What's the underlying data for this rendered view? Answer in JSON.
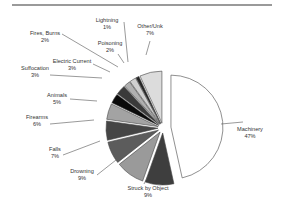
{
  "chart_data": {
    "type": "pie",
    "title": "",
    "exploded": true,
    "start_angle_deg": 0,
    "direction": "clockwise",
    "slices": [
      {
        "label": "Machinery",
        "value": 47,
        "pct_label": "47%",
        "color": "#ffffff",
        "explode": 8
      },
      {
        "label": "Struck by Object",
        "value": 9,
        "pct_label": "9%",
        "color": "#3e3e3e",
        "explode": 5
      },
      {
        "label": "Drowning",
        "value": 9,
        "pct_label": "9%",
        "color": "#9a9a9a",
        "explode": 5
      },
      {
        "label": "Falls",
        "value": 7,
        "pct_label": "7%",
        "color": "#5c5c5c",
        "explode": 5
      },
      {
        "label": "Firearms",
        "value": 6,
        "pct_label": "6%",
        "color": "#454545",
        "explode": 5
      },
      {
        "label": "Animals",
        "value": 5,
        "pct_label": "5%",
        "color": "#a3a3a3",
        "explode": 5
      },
      {
        "label": "Suffocation",
        "value": 3,
        "pct_label": "3%",
        "color": "#0a0a0a",
        "explode": 5
      },
      {
        "label": "Electric Current",
        "value": 3,
        "pct_label": "3%",
        "color": "#3a3a3a",
        "explode": 5
      },
      {
        "label": "Fires, Burns",
        "value": 2,
        "pct_label": "2%",
        "color": "#b0b0b0",
        "explode": 5
      },
      {
        "label": "Poisoning",
        "value": 2,
        "pct_label": "2%",
        "color": "#cfcfcf",
        "explode": 5
      },
      {
        "label": "Lightning",
        "value": 1,
        "pct_label": "1%",
        "color": "#262626",
        "explode": 5
      },
      {
        "label": "Other/Unk",
        "value": 7,
        "pct_label": "7%",
        "color": "#dcdcdc",
        "explode": 5
      }
    ],
    "legend": "none",
    "labels_position": "outside with leader lines"
  },
  "labels": [
    {
      "name": "Machinery",
      "pct": "47%",
      "x": 250,
      "y": 131,
      "lx1": 221,
      "ly1": 124,
      "lx2": 243,
      "ly2": 122
    },
    {
      "name": "Struck by Object",
      "pct": "9%",
      "x": 148,
      "y": 190,
      "lx1": 148,
      "ly1": 176,
      "lx2": 144,
      "ly2": 184
    },
    {
      "name": "Drowning",
      "pct": "9%",
      "x": 82,
      "y": 173,
      "lx1": 116,
      "ly1": 160,
      "lx2": 97,
      "ly2": 175
    },
    {
      "name": "Falls",
      "pct": "7%",
      "x": 55,
      "y": 151,
      "lx1": 100,
      "ly1": 141,
      "lx2": 63,
      "ly2": 155
    },
    {
      "name": "Firearms",
      "pct": "6%",
      "x": 37,
      "y": 119,
      "lx1": 94,
      "ly1": 120,
      "lx2": 50,
      "ly2": 124
    },
    {
      "name": "Animals",
      "pct": "5%",
      "x": 57,
      "y": 97,
      "lx1": 97,
      "ly1": 101,
      "lx2": 70,
      "ly2": 99
    },
    {
      "name": "Suffocation",
      "pct": "3%",
      "x": 35,
      "y": 70,
      "lx1": 102,
      "ly1": 78,
      "lx2": 50,
      "ly2": 75
    },
    {
      "name": "Electric Current",
      "pct": "3%",
      "x": 72,
      "y": 63,
      "lx1": 110,
      "ly1": 72,
      "lx2": 93,
      "ly2": 64
    },
    {
      "name": "Fires, Burns",
      "pct": "2%",
      "x": 45,
      "y": 35,
      "lx1": 118,
      "ly1": 67,
      "lx2": 62,
      "ly2": 34
    },
    {
      "name": "Poisoning",
      "pct": "2%",
      "x": 110,
      "y": 45,
      "lx1": 124,
      "ly1": 63,
      "lx2": 118,
      "ly2": 54
    },
    {
      "name": "Lightning",
      "pct": "1%",
      "x": 107,
      "y": 22,
      "lx1": 128,
      "ly1": 62,
      "lx2": 124,
      "ly2": 22
    },
    {
      "name": "Other/Unk",
      "pct": "7%",
      "x": 150,
      "y": 28,
      "lx1": 146,
      "ly1": 55,
      "lx2": 150,
      "ly2": 41
    }
  ],
  "geometry": {
    "cx": 163,
    "cy": 128,
    "r": 52
  }
}
